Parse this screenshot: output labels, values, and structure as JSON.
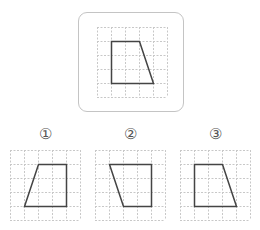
{
  "question": {
    "grid": {
      "cols": 5,
      "rows": 5,
      "cell": 14,
      "line_color": "#c8c8c8",
      "shape_color": "#444444"
    },
    "reference": {
      "origin": [
        97,
        27
      ],
      "shape": [
        [
          1,
          1
        ],
        [
          3,
          1
        ],
        [
          4,
          4
        ],
        [
          1,
          4
        ]
      ]
    },
    "options": [
      {
        "label": "①",
        "origin": [
          10,
          150
        ],
        "label_center": [
          45,
          134
        ],
        "shape": [
          [
            2,
            1
          ],
          [
            4,
            1
          ],
          [
            4,
            4
          ],
          [
            1,
            4
          ]
        ]
      },
      {
        "label": "②",
        "origin": [
          95,
          150
        ],
        "label_center": [
          130,
          134
        ],
        "shape": [
          [
            1,
            1
          ],
          [
            4,
            1
          ],
          [
            4,
            4
          ],
          [
            2,
            4
          ]
        ]
      },
      {
        "label": "③",
        "origin": [
          180,
          150
        ],
        "label_center": [
          215,
          134
        ],
        "shape": [
          [
            1,
            1
          ],
          [
            3,
            1
          ],
          [
            4,
            4
          ],
          [
            1,
            4
          ]
        ]
      }
    ]
  }
}
